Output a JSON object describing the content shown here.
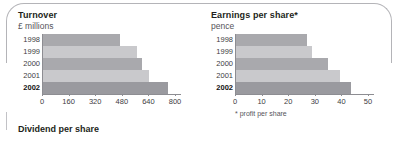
{
  "panel": {
    "frame_color": "#b4b4b8",
    "background": "#ffffff"
  },
  "bottom_heading": "Dividend per share",
  "chart_data": [
    {
      "id": "turnover",
      "type": "bar",
      "orientation": "horizontal",
      "title": "Turnover",
      "subtitle": "£ millions",
      "xlabel": "",
      "ylabel": "",
      "categories": [
        "1998",
        "1999",
        "2000",
        "2001",
        "2002"
      ],
      "values": [
        470,
        570,
        600,
        645,
        755
      ],
      "xlim": [
        0,
        800
      ],
      "xticks": [
        0,
        160,
        320,
        480,
        640,
        800
      ],
      "xticklabels": [
        "0",
        "160",
        "320",
        "480",
        "640",
        "800"
      ],
      "grid": false,
      "legend": "none",
      "highlight_category": "2002",
      "bar_colors": [
        "#a9a9ad",
        "#c9c9cc",
        "#a9a9ad",
        "#c9c9cc",
        "#9a9a9f"
      ]
    },
    {
      "id": "eps",
      "type": "bar",
      "orientation": "horizontal",
      "title": "Earnings per share*",
      "subtitle": "pence",
      "footnote": "* profit per share",
      "xlabel": "",
      "ylabel": "",
      "categories": [
        "1998",
        "1999",
        "2000",
        "2001",
        "2002"
      ],
      "values": [
        27,
        29,
        35,
        39.5,
        43.5
      ],
      "xlim": [
        0,
        50
      ],
      "xticks": [
        0,
        10,
        20,
        30,
        40,
        50
      ],
      "xticklabels": [
        "0",
        "10",
        "20",
        "30",
        "40",
        "50"
      ],
      "grid": false,
      "legend": "none",
      "highlight_category": "2002",
      "bar_colors": [
        "#a9a9ad",
        "#c9c9cc",
        "#a9a9ad",
        "#c9c9cc",
        "#9a9a9f"
      ]
    }
  ]
}
